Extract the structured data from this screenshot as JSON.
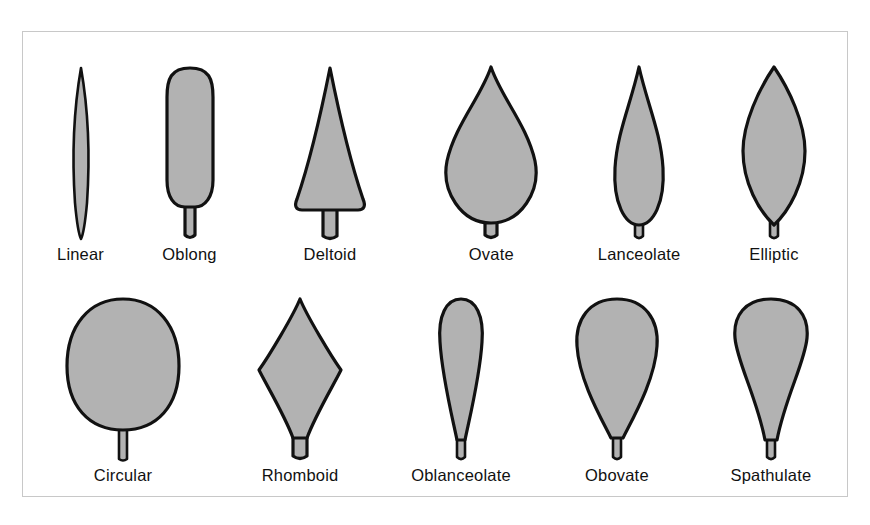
{
  "figure": {
    "border_color": "#c8c8c8",
    "background_color": "#ffffff",
    "leaf_fill_color": "#b2b2b2",
    "leaf_outline_color": "#111111"
  },
  "rows": [
    {
      "name": "top-row",
      "leaves": [
        {
          "label": "Linear",
          "shape": "linear"
        },
        {
          "label": "Oblong",
          "shape": "oblong"
        },
        {
          "label": "Deltoid",
          "shape": "deltoid"
        },
        {
          "label": "Ovate",
          "shape": "ovate"
        },
        {
          "label": "Lanceolate",
          "shape": "lanceolate"
        },
        {
          "label": "Elliptic",
          "shape": "elliptic"
        }
      ]
    },
    {
      "name": "bottom-row",
      "leaves": [
        {
          "label": "Circular",
          "shape": "circular"
        },
        {
          "label": "Rhomboid",
          "shape": "rhomboid"
        },
        {
          "label": "Oblanceolate",
          "shape": "oblanceolate"
        },
        {
          "label": "Obovate",
          "shape": "obovate"
        },
        {
          "label": "Spathulate",
          "shape": "spathulate"
        }
      ]
    }
  ]
}
